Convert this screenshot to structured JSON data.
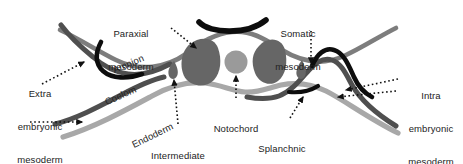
{
  "figure": {
    "background_color": "#ffffff",
    "width": 463,
    "height": 164
  },
  "palette": {
    "ectoderm_black": "#0d0d0d",
    "mesoderm_dark_gray": "#555555",
    "paraxial_fill": "#666666",
    "notochord_gray": "#9a9a9a",
    "endoderm_light_gray": "#a8a8a8",
    "amnion_mid_gray": "#6e6e6e",
    "text_color": "#232323",
    "arrow_color": "#111111"
  },
  "labels": [
    {
      "id": "paraxial-mesoderm",
      "lines": [
        "Paraxial",
        "mesoderm"
      ],
      "text": "Paraxial mesoderm",
      "x": 131,
      "y": 8,
      "align": "center",
      "rotation": 0
    },
    {
      "id": "somatic-mesoderm",
      "lines": [
        "Somatic",
        "mesoderm"
      ],
      "text": "Somatic mesoderm",
      "x": 296,
      "y": 8,
      "align": "center",
      "rotation": 0
    },
    {
      "id": "extra-embryonic-mesoderm",
      "lines": [
        "Extra",
        "embryonic",
        "mesoderm"
      ],
      "text": "Extra embryonic mesoderm",
      "x": 14,
      "y": 68,
      "align": "center",
      "rotation": 0
    },
    {
      "id": "intra-embryonic-mesoderm",
      "lines": [
        "Intra",
        "embryonic",
        "mesoderm"
      ],
      "text": "Intra embryonic mesoderm",
      "x": 405,
      "y": 70,
      "align": "center",
      "rotation": 0
    },
    {
      "id": "notochord",
      "lines": [
        "Notochord"
      ],
      "text": "Notochord",
      "x": 211,
      "y": 104,
      "align": "center",
      "rotation": 0
    },
    {
      "id": "intermediate-mesoderm",
      "lines": [
        "Intermediate",
        "mesoderm"
      ],
      "text": "Intermediate mesoderm",
      "x": 173,
      "y": 130,
      "align": "center",
      "rotation": 0
    },
    {
      "id": "splanchnic-mesoderm",
      "lines": [
        "Splanchnic",
        "mesoderm"
      ],
      "text": "Splanchnic mesoderm",
      "x": 276,
      "y": 124,
      "align": "center",
      "rotation": 0
    }
  ],
  "rotated_labels": [
    {
      "id": "amnion",
      "text": "Amnion",
      "x": 112,
      "y": 64,
      "rotation": -23
    },
    {
      "id": "coelom",
      "text": "Coelom",
      "x": 104,
      "y": 95,
      "rotation": -24
    },
    {
      "id": "endoderm",
      "text": "Endoderm",
      "x": 133,
      "y": 136,
      "rotation": -26
    }
  ],
  "structures": [
    {
      "id": "neural-plate",
      "kind": "arc",
      "color": "#0d0d0d"
    },
    {
      "id": "paraxial-mesoderm-left",
      "kind": "blob",
      "color": "#666666"
    },
    {
      "id": "paraxial-mesoderm-right",
      "kind": "blob",
      "color": "#666666"
    },
    {
      "id": "notochord-body",
      "kind": "circle",
      "color": "#9a9a9a"
    },
    {
      "id": "intermediate-mesoderm-droplet",
      "kind": "droplet",
      "color": "#666666"
    },
    {
      "id": "amnion-fold-left",
      "kind": "stroke",
      "color": "#0d0d0d"
    },
    {
      "id": "amnion-fold-right",
      "kind": "stroke",
      "color": "#0d0d0d"
    },
    {
      "id": "ectoderm-layer",
      "kind": "stroke",
      "color": "#6e6e6e"
    },
    {
      "id": "mesoderm-layer-left",
      "kind": "stroke",
      "color": "#555555"
    },
    {
      "id": "mesoderm-layer-right",
      "kind": "stroke",
      "color": "#555555"
    },
    {
      "id": "endoderm-layer",
      "kind": "stroke",
      "color": "#a8a8a8"
    }
  ],
  "pointers": [
    {
      "id": "pointer-paraxial",
      "style": "dotted-arrow",
      "from": "paraxial-mesoderm",
      "to": "paraxial-mesoderm-left"
    },
    {
      "id": "pointer-somatic",
      "style": "dotted-arrow",
      "from": "somatic-mesoderm",
      "to": "mesoderm-layer-right"
    },
    {
      "id": "pointer-extra-embryonic",
      "style": "dotted-arrow",
      "from": "extra-embryonic-mesoderm",
      "to": "amnion-fold-left"
    },
    {
      "id": "pointer-extra-embryonic-2",
      "style": "dotted-arrow",
      "from": "extra-embryonic-mesoderm",
      "to": "mesoderm-layer-left"
    },
    {
      "id": "pointer-intra-embryonic",
      "style": "dotted-arrow",
      "from": "intra-embryonic-mesoderm",
      "to": "ectoderm-layer"
    },
    {
      "id": "pointer-intra-embryonic-2",
      "style": "dotted-arrow",
      "from": "intra-embryonic-mesoderm",
      "to": "mesoderm-layer-right"
    },
    {
      "id": "pointer-notochord",
      "style": "dotted-arrow",
      "from": "notochord",
      "to": "notochord-body"
    },
    {
      "id": "pointer-intermediate",
      "style": "dotted-arrow",
      "from": "intermediate-mesoderm",
      "to": "intermediate-mesoderm-droplet"
    },
    {
      "id": "pointer-splanchnic",
      "style": "dotted-arrow",
      "from": "splanchnic-mesoderm",
      "to": "mesoderm-layer-right"
    }
  ]
}
